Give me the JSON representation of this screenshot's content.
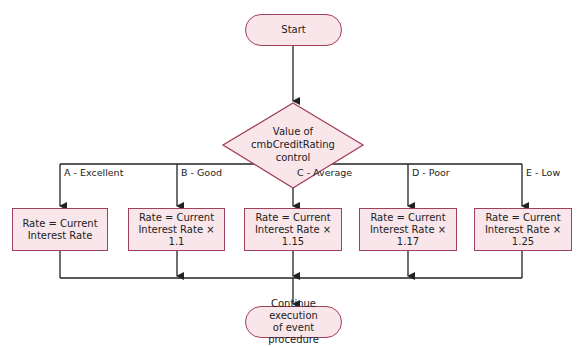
{
  "diagram": {
    "type": "flowchart",
    "colors": {
      "node_fill": "#f9e6ea",
      "node_border": "#a0405a",
      "line": "#222222"
    },
    "start": {
      "label": "Start"
    },
    "decision": {
      "line1": "Value of",
      "line2": "cmbCreditRating",
      "line3": "control"
    },
    "branches": [
      {
        "label": "A - Excellent",
        "action_line1": "Rate = Current",
        "action_line2": "Interest Rate"
      },
      {
        "label": "B - Good",
        "action_line1": "Rate = Current",
        "action_line2": "Interest Rate × 1.1"
      },
      {
        "label": "C - Average",
        "action_line1": "Rate = Current",
        "action_line2": "Interest Rate × 1.15"
      },
      {
        "label": "D - Poor",
        "action_line1": "Rate = Current",
        "action_line2": "Interest Rate × 1.17"
      },
      {
        "label": "E - Low",
        "action_line1": "Rate = Current",
        "action_line2": "Interest Rate × 1.25"
      }
    ],
    "end": {
      "line1": "Continue execution",
      "line2": "of event procedure"
    }
  }
}
